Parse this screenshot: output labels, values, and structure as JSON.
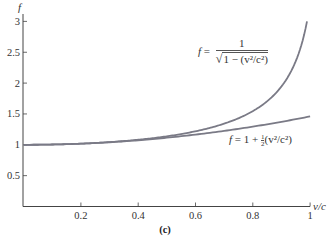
{
  "chart_data": {
    "type": "line",
    "title": "",
    "caption": "(c)",
    "xlabel": "v/c",
    "ylabel": "f",
    "xlim": [
      0,
      1
    ],
    "ylim": [
      0,
      3
    ],
    "x_ticks": [
      "0.2",
      "0.4",
      "0.6",
      "0.8",
      "1"
    ],
    "y_ticks": [
      "0.5",
      "1",
      "1.5",
      "2",
      "2.5",
      "3"
    ],
    "grid": false,
    "legend": "inline annotations",
    "series": [
      {
        "name": "f = 1/sqrt(1 - (v^2/c^2))",
        "x": [
          0,
          0.2,
          0.4,
          0.6,
          0.7,
          0.8,
          0.85,
          0.9,
          0.9428
        ],
        "values": [
          1.0,
          1.02,
          1.09,
          1.25,
          1.4,
          1.67,
          1.9,
          2.29,
          3.0
        ]
      },
      {
        "name": "f = 1 + (1/2)(v^2/c^2)",
        "x": [
          0,
          0.2,
          0.4,
          0.6,
          0.8,
          1.0
        ],
        "values": [
          1.0,
          1.02,
          1.08,
          1.18,
          1.32,
          1.5
        ]
      }
    ],
    "line_color": "#7a7a86"
  },
  "labels": {
    "y_axis": "f",
    "x_axis": "v/c",
    "caption": "(c)",
    "eq1_lhs": "f",
    "eq1_eq": " = ",
    "eq1_num": "1",
    "eq1_den": "1 − (v²/c²)",
    "eq2_lhs": "f",
    "eq2_text": " = 1 + ",
    "eq2_half_n": "1",
    "eq2_half_d": "2",
    "eq2_tail": "(v²/c²)"
  }
}
